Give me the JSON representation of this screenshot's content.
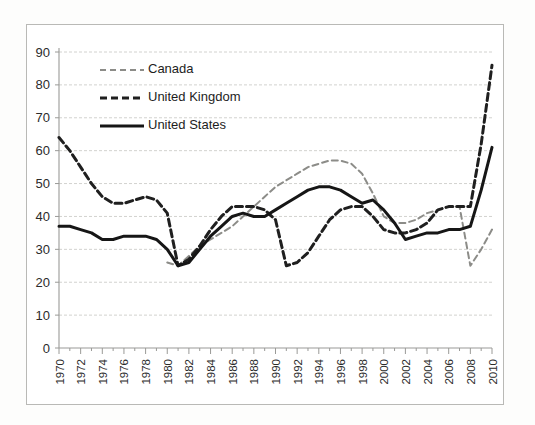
{
  "chart_data": {
    "type": "line",
    "title": "",
    "subtitle": "",
    "xlabel": "",
    "ylabel": "",
    "ylim": [
      0,
      90
    ],
    "xlim": [
      1970,
      2010
    ],
    "ytick_step": 10,
    "yticks": [
      "0",
      "10",
      "20",
      "30",
      "40",
      "50",
      "60",
      "70",
      "80",
      "90"
    ],
    "xticks": [
      "1970",
      "1972",
      "1974",
      "1976",
      "1978",
      "1980",
      "1982",
      "1984",
      "1986",
      "1988",
      "1990",
      "1992",
      "1994",
      "1996",
      "1998",
      "2000",
      "2002",
      "2004",
      "2006",
      "2008",
      "2010"
    ],
    "x": [
      1970,
      1971,
      1972,
      1973,
      1974,
      1975,
      1976,
      1977,
      1978,
      1979,
      1980,
      1981,
      1982,
      1983,
      1984,
      1985,
      1986,
      1987,
      1988,
      1989,
      1990,
      1991,
      1992,
      1993,
      1994,
      1995,
      1996,
      1997,
      1998,
      1999,
      2000,
      2001,
      2002,
      2003,
      2004,
      2005,
      2006,
      2007,
      2008,
      2009,
      2010
    ],
    "grid": "horizontal",
    "legend_position": "upper-left-inside",
    "series": [
      {
        "name": "Canada",
        "style": "dashed-light",
        "color": "#8c8c88",
        "values": [
          null,
          null,
          null,
          null,
          null,
          null,
          null,
          null,
          null,
          null,
          26,
          25,
          28,
          31,
          33,
          35,
          37,
          40,
          43,
          46,
          49,
          51,
          53,
          55,
          56,
          57,
          57,
          56,
          53,
          47,
          40,
          38,
          38,
          39,
          41,
          42,
          43,
          43,
          25,
          30,
          36
        ]
      },
      {
        "name": "United Kingdom",
        "style": "dashed-dark",
        "color": "#1f1f1f",
        "values": [
          64,
          60,
          55,
          50,
          46,
          44,
          44,
          45,
          46,
          45,
          41,
          25,
          27,
          31,
          36,
          40,
          43,
          43,
          43,
          42,
          39,
          25,
          26,
          29,
          34,
          39,
          42,
          43,
          43,
          40,
          36,
          35,
          35,
          36,
          38,
          42,
          43,
          43,
          43,
          62,
          86
        ]
      },
      {
        "name": "United States",
        "style": "solid",
        "color": "#161616",
        "values": [
          37,
          37,
          36,
          35,
          33,
          33,
          34,
          34,
          34,
          33,
          30,
          25,
          26,
          30,
          34,
          37,
          40,
          41,
          40,
          40,
          42,
          44,
          46,
          48,
          49,
          49,
          48,
          46,
          44,
          45,
          42,
          38,
          33,
          34,
          35,
          35,
          36,
          36,
          37,
          48,
          61
        ]
      }
    ]
  },
  "legend": {
    "items": [
      {
        "label": "Canada",
        "swatch": "dashed-light-swatch"
      },
      {
        "label": "United Kingdom",
        "swatch": "dashed-dark-swatch"
      },
      {
        "label": "United States",
        "swatch": "solid-swatch"
      }
    ]
  }
}
